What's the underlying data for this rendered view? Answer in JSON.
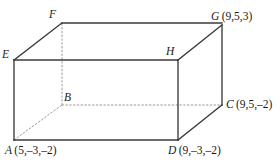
{
  "figure": {
    "type": "rectangular-box-oblique-projection",
    "stroke_color": "#3a3a3a",
    "hidden_edge_color": "#9a9a9a",
    "background_color": "#ffffff",
    "vertices": [
      {
        "id": "A",
        "label": "A",
        "coords": "(5,–3,–2)",
        "x": 14,
        "y": 140,
        "hidden": false
      },
      {
        "id": "B",
        "label": "B",
        "coords": "",
        "x": 62,
        "y": 105,
        "hidden": true
      },
      {
        "id": "C",
        "label": "C",
        "coords": "(9,5,–2)",
        "x": 222,
        "y": 105,
        "hidden": false
      },
      {
        "id": "D",
        "label": "D",
        "coords": "(9,–3,–2)",
        "x": 178,
        "y": 140,
        "hidden": false
      },
      {
        "id": "E",
        "label": "E",
        "coords": "",
        "x": 14,
        "y": 60,
        "hidden": false
      },
      {
        "id": "F",
        "label": "F",
        "coords": "",
        "x": 62,
        "y": 23,
        "hidden": false
      },
      {
        "id": "G",
        "label": "G",
        "coords": "(9,5,3)",
        "x": 222,
        "y": 25,
        "hidden": false
      },
      {
        "id": "H",
        "label": "H",
        "coords": "",
        "x": 178,
        "y": 60,
        "hidden": false
      }
    ],
    "edges": [
      {
        "from": "A",
        "to": "D",
        "hidden": false
      },
      {
        "from": "A",
        "to": "E",
        "hidden": false
      },
      {
        "from": "D",
        "to": "H",
        "hidden": false
      },
      {
        "from": "E",
        "to": "H",
        "hidden": false
      },
      {
        "from": "E",
        "to": "F",
        "hidden": false
      },
      {
        "from": "F",
        "to": "G",
        "hidden": false
      },
      {
        "from": "H",
        "to": "G",
        "hidden": false
      },
      {
        "from": "D",
        "to": "C",
        "hidden": false
      },
      {
        "from": "G",
        "to": "C",
        "hidden": false
      },
      {
        "from": "A",
        "to": "B",
        "hidden": true
      },
      {
        "from": "B",
        "to": "F",
        "hidden": true
      },
      {
        "from": "B",
        "to": "C",
        "hidden": true
      }
    ]
  },
  "labels": {
    "A": {
      "point": "A",
      "coords": "(5,–3,–2)"
    },
    "B": {
      "point": "B",
      "coords": ""
    },
    "C": {
      "point": "C",
      "coords": "(9,5,–2)"
    },
    "D": {
      "point": "D",
      "coords": "(9,–3,–2)"
    },
    "E": {
      "point": "E",
      "coords": ""
    },
    "F": {
      "point": "F",
      "coords": ""
    },
    "G": {
      "point": "G",
      "coords": "(9,5,3)"
    },
    "H": {
      "point": "H",
      "coords": ""
    }
  }
}
